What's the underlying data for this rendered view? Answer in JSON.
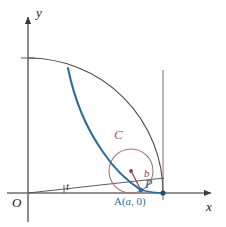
{
  "figure": {
    "kind": "geometric-diagram",
    "width": 226,
    "height": 227,
    "background": "#ffffff"
  },
  "axes": {
    "x_label": "x",
    "y_label": "y",
    "origin_label": "O",
    "axis_color": "#6e6e6e",
    "origin_px": {
      "x": 28,
      "y": 193
    },
    "x_axis_end_px": {
      "x": 214,
      "y": 193
    },
    "y_axis_end_px": {
      "x": 28,
      "y": 14
    }
  },
  "labels": {
    "angle": "t",
    "rolling_circle": "C",
    "radius": "b",
    "point": "P",
    "point_a": "A(a, 0)",
    "point_a_prefix": "A(",
    "point_a_var": "a",
    "point_a_suffix": ", 0)"
  },
  "colors": {
    "curve_blue": "#2c6f9b",
    "circle_rose": "#a8736e",
    "radius_red": "#8e3f3d",
    "outer_arc": "#4a4a4a",
    "axis_gray": "#6e6e6e",
    "label_C": "#9e5f5c",
    "label_A": "#2c6f9b",
    "point_dot_blue": "#2c6f9b",
    "center_dot_red": "#8e3f3d",
    "background": "#ffffff"
  },
  "geometry": {
    "outer_arc_radius_px": 135,
    "outer_arc_start_px": {
      "x": 28,
      "y": 58
    },
    "outer_arc_end_px": {
      "x": 163,
      "y": 193
    },
    "rolling_circle_center_px": {
      "x": 131,
      "y": 171
    },
    "rolling_circle_radius_px": 22,
    "point_P_px": {
      "x": 141,
      "y": 190
    },
    "point_A_px": {
      "x": 163,
      "y": 193
    },
    "angle_ray_end_px": {
      "x": 163,
      "y": 179
    },
    "angle_t_degrees": 10,
    "traced_curve_start_px": {
      "x": 68,
      "y": 68
    },
    "traced_curve_end_px": {
      "x": 141,
      "y": 190
    },
    "y_tick_px": {
      "x": 28,
      "y": 58
    },
    "vertical_chord_px": {
      "x": 163,
      "y_top": 70,
      "y_bottom": 200
    }
  }
}
